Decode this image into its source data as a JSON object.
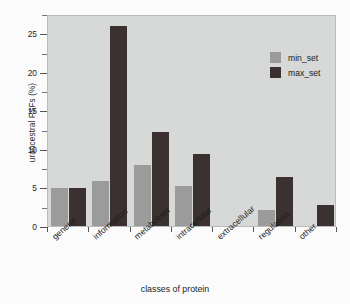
{
  "chart_data": {
    "type": "bar",
    "title": "",
    "xlabel": "classes of protein",
    "ylabel": "urancestral FSFs (%)",
    "categories": [
      "general",
      "information",
      "metabolism",
      "intracellular",
      "extracellular",
      "regulation",
      "other"
    ],
    "series": [
      {
        "name": "min_set",
        "color": "#9b9b9b",
        "values": [
          4.9,
          5.8,
          7.9,
          5.2,
          0,
          2.1,
          0
        ]
      },
      {
        "name": "max_set",
        "color": "#3b3130",
        "values": [
          4.9,
          25.9,
          12.2,
          9.3,
          0,
          6.4,
          2.7
        ]
      }
    ],
    "ylim": [
      0,
      27.5
    ],
    "yticks": [
      0,
      5,
      10,
      15,
      20,
      25
    ],
    "ytick_labels": [
      "0",
      "5",
      "10",
      "15",
      "20",
      "25"
    ],
    "yminor_ticks": [
      2.5,
      7.5,
      12.5,
      17.5,
      22.5,
      27.5
    ],
    "grid": false,
    "legend_position": "top-right",
    "legend": [
      "min_set",
      "max_set"
    ],
    "plot_background": "#d6d9d7",
    "figure_background": "#fbfbfb"
  }
}
